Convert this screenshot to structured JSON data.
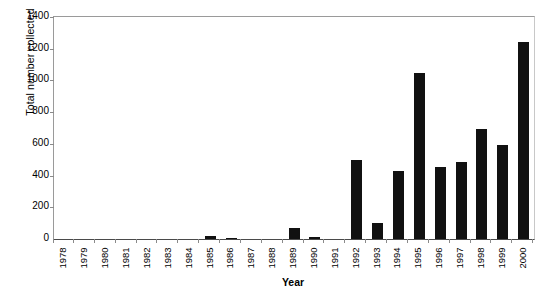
{
  "chart_data": {
    "type": "bar",
    "title": "",
    "xlabel": "Year",
    "ylabel": "Total number collected",
    "categories": [
      "1978",
      "1979",
      "1980",
      "1981",
      "1982",
      "1983",
      "1984",
      "1985",
      "1986",
      "1987",
      "1988",
      "1989",
      "1990",
      "1991",
      "1992",
      "1993",
      "1994",
      "1995",
      "1996",
      "1997",
      "1998",
      "1999",
      "2000"
    ],
    "values": [
      0,
      0,
      0,
      0,
      0,
      0,
      0,
      20,
      5,
      0,
      0,
      70,
      10,
      0,
      500,
      100,
      430,
      1045,
      455,
      485,
      695,
      595,
      1245
    ],
    "ylim": [
      0,
      1400
    ],
    "yticks": [
      0,
      200,
      400,
      600,
      800,
      1000,
      1200,
      1400
    ],
    "ytick_labels": [
      "0",
      "200",
      "400",
      "600",
      "800",
      "1000",
      "1200",
      "1400"
    ],
    "grid": false,
    "legend": "none",
    "bar_color": "#111111",
    "axis_color": "#8a8a8a",
    "series": [
      {
        "name": "Total number collected",
        "values": [
          0,
          0,
          0,
          0,
          0,
          0,
          0,
          20,
          5,
          0,
          0,
          70,
          10,
          0,
          500,
          100,
          430,
          1045,
          455,
          485,
          695,
          595,
          1245
        ]
      }
    ]
  }
}
